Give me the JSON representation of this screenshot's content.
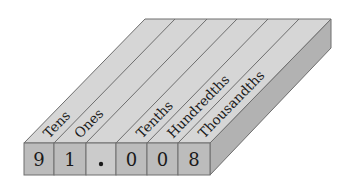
{
  "diagram": {
    "number": "91.008",
    "columns": [
      {
        "label": "Tens",
        "digit": "9"
      },
      {
        "label": "Ones",
        "digit": "1"
      },
      {
        "label": "",
        "digit": "."
      },
      {
        "label": "Tenths",
        "digit": "0"
      },
      {
        "label": "Hundredths",
        "digit": "0"
      },
      {
        "label": "Thousandths",
        "digit": "8"
      }
    ],
    "colors": {
      "top_face": "#d6d6d6",
      "front_face": "#bcbcbc",
      "decimal_cell": "#cbcbcb",
      "side_face": "#b2b2b2",
      "edge": "#6e6e6e",
      "text": "#1a1a1a"
    }
  }
}
